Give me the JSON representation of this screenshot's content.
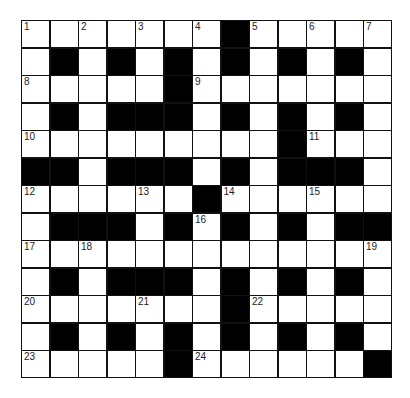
{
  "puzzle": {
    "rows": 13,
    "cols": 13,
    "grid": [
      "..............",
      ""
    ],
    "layout": [
      "WWWWWWWBWWWWW",
      "WBWBWBWBWBWBW",
      "WWWWWBWWWWWWW",
      "WBWBBBWBWBWBW",
      "WWWWWWWWWBWWW",
      "BBWBBBWBWBBBW",
      "WWWWWWBWWWWWW",
      "WBBBWBWBWBWBB",
      "WWWWWWWWWWWWW",
      "WBWBBBWBWBWBW",
      "WWWWWWWBWWWWW",
      "WBWBWBWBWBWBW",
      "WWWWWBWWWWWWB"
    ],
    "numbers": [
      {
        "r": 0,
        "c": 0,
        "n": "1"
      },
      {
        "r": 0,
        "c": 2,
        "n": "2"
      },
      {
        "r": 0,
        "c": 4,
        "n": "3"
      },
      {
        "r": 0,
        "c": 6,
        "n": "4"
      },
      {
        "r": 0,
        "c": 8,
        "n": "5"
      },
      {
        "r": 0,
        "c": 10,
        "n": "6"
      },
      {
        "r": 0,
        "c": 12,
        "n": "7"
      },
      {
        "r": 2,
        "c": 0,
        "n": "8"
      },
      {
        "r": 2,
        "c": 6,
        "n": "9"
      },
      {
        "r": 4,
        "c": 0,
        "n": "10"
      },
      {
        "r": 4,
        "c": 10,
        "n": "11"
      },
      {
        "r": 6,
        "c": 0,
        "n": "12"
      },
      {
        "r": 6,
        "c": 4,
        "n": "13"
      },
      {
        "r": 6,
        "c": 7,
        "n": "14"
      },
      {
        "r": 6,
        "c": 10,
        "n": "15"
      },
      {
        "r": 7,
        "c": 6,
        "n": "16"
      },
      {
        "r": 8,
        "c": 0,
        "n": "17"
      },
      {
        "r": 8,
        "c": 2,
        "n": "18"
      },
      {
        "r": 8,
        "c": 12,
        "n": "19"
      },
      {
        "r": 10,
        "c": 0,
        "n": "20"
      },
      {
        "r": 10,
        "c": 4,
        "n": "21"
      },
      {
        "r": 10,
        "c": 8,
        "n": "22"
      },
      {
        "r": 12,
        "c": 0,
        "n": "23"
      },
      {
        "r": 12,
        "c": 6,
        "n": "24"
      }
    ]
  }
}
